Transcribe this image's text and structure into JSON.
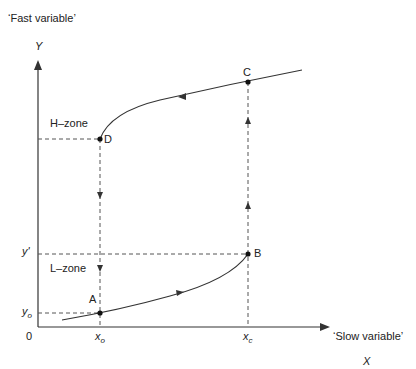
{
  "labels": {
    "y_axis_desc": "‘Fast variable’",
    "y_axis_symbol": "Y",
    "x_axis_desc": "‘Slow variable’",
    "x_axis_symbol": "X",
    "origin": "0",
    "h_zone": "H–zone",
    "l_zone": "L–zone"
  },
  "ticks": {
    "y_prime": "y'",
    "y_o": "y",
    "y_o_sub": "o",
    "x_o": "x",
    "x_o_sub": "o",
    "x_c": "x",
    "x_c_sub": "c"
  },
  "points": {
    "A": "A",
    "B": "B",
    "C": "C",
    "D": "D"
  },
  "colors": {
    "line": "#333333",
    "dash": "#555555"
  }
}
